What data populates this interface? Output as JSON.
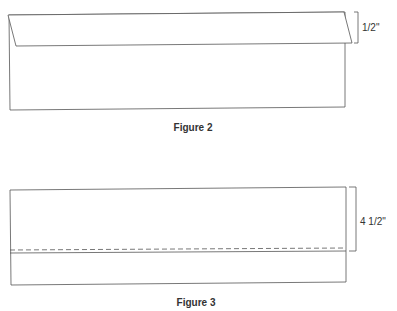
{
  "figures": [
    {
      "caption": "Figure 2",
      "dimension_label": "1/2\"",
      "description": "Long rectangle with top edge folded down 1/2 inch"
    },
    {
      "caption": "Figure 3",
      "dimension_label": "4 1/2\"",
      "description": "Rectangle with dashed stitching line 4 1/2 inches from top"
    }
  ],
  "colors": {
    "line": "#555555",
    "background": "#ffffff"
  }
}
